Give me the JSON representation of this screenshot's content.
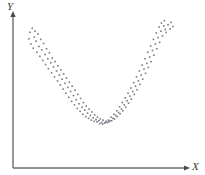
{
  "figure": {
    "kind": "scatter-plot",
    "background_color": "#ffffff",
    "axis_color": "#6b6b6b",
    "point_color": "#7a7a86",
    "width": 205,
    "height": 175
  },
  "axes": {
    "x": {
      "label": "X",
      "arrow": "arrow-right",
      "start_px": 13,
      "end_px": 189,
      "baseline_px": 168
    },
    "y": {
      "label": "Y",
      "arrow": "arrow-up",
      "start_px": 168,
      "end_px": 14,
      "baseline_px": 13
    }
  },
  "chart_data": {
    "type": "scatter",
    "title": "",
    "xlabel": "X",
    "ylabel": "Y",
    "xlim": [
      0,
      100
    ],
    "ylim": [
      0,
      100
    ],
    "grid": false,
    "legend": null,
    "annotations": [],
    "series": [
      {
        "name": "observations",
        "marker": "square",
        "marker_size_px": 1.6,
        "color": "#7a7a86",
        "points": [
          [
            6.0,
            86.0
          ],
          [
            7.4,
            89.5
          ],
          [
            9.1,
            87.0
          ],
          [
            5.4,
            80.5
          ],
          [
            8.6,
            82.0
          ],
          [
            10.8,
            84.5
          ],
          [
            6.6,
            76.0
          ],
          [
            9.7,
            78.5
          ],
          [
            12.5,
            80.0
          ],
          [
            8.0,
            72.5
          ],
          [
            11.4,
            74.0
          ],
          [
            14.2,
            76.5
          ],
          [
            10.2,
            69.0
          ],
          [
            13.1,
            71.0
          ],
          [
            16.0,
            72.0
          ],
          [
            12.0,
            65.5
          ],
          [
            15.1,
            67.0
          ],
          [
            17.7,
            68.5
          ],
          [
            13.7,
            62.0
          ],
          [
            16.8,
            63.5
          ],
          [
            19.4,
            64.0
          ],
          [
            15.4,
            58.5
          ],
          [
            18.5,
            60.0
          ],
          [
            21.1,
            61.0
          ],
          [
            17.1,
            55.0
          ],
          [
            20.2,
            56.5
          ],
          [
            22.8,
            57.5
          ],
          [
            19.0,
            51.5
          ],
          [
            22.0,
            53.0
          ],
          [
            24.6,
            54.0
          ],
          [
            20.8,
            48.0
          ],
          [
            23.7,
            49.5
          ],
          [
            26.3,
            50.5
          ],
          [
            22.6,
            44.5
          ],
          [
            25.4,
            46.0
          ],
          [
            28.0,
            47.0
          ],
          [
            24.3,
            41.0
          ],
          [
            27.1,
            42.5
          ],
          [
            29.7,
            43.5
          ],
          [
            26.0,
            37.5
          ],
          [
            28.8,
            39.0
          ],
          [
            31.4,
            40.0
          ],
          [
            27.7,
            34.0
          ],
          [
            30.5,
            35.5
          ],
          [
            33.1,
            36.5
          ],
          [
            29.4,
            30.5
          ],
          [
            32.2,
            32.0
          ],
          [
            34.8,
            33.0
          ],
          [
            31.1,
            27.0
          ],
          [
            33.9,
            28.5
          ],
          [
            36.5,
            29.5
          ],
          [
            32.8,
            24.0
          ],
          [
            35.6,
            25.0
          ],
          [
            38.2,
            26.0
          ],
          [
            34.5,
            21.0
          ],
          [
            37.3,
            22.0
          ],
          [
            39.9,
            23.0
          ],
          [
            36.2,
            18.5
          ],
          [
            39.0,
            19.5
          ],
          [
            41.6,
            20.5
          ],
          [
            37.9,
            16.0
          ],
          [
            40.7,
            17.0
          ],
          [
            43.3,
            18.0
          ],
          [
            39.6,
            14.0
          ],
          [
            42.4,
            15.0
          ],
          [
            45.0,
            15.5
          ],
          [
            41.3,
            12.5
          ],
          [
            44.1,
            13.0
          ],
          [
            46.7,
            13.5
          ],
          [
            43.0,
            11.0
          ],
          [
            45.8,
            11.5
          ],
          [
            48.4,
            12.0
          ],
          [
            44.7,
            10.0
          ],
          [
            47.5,
            10.5
          ],
          [
            50.1,
            11.0
          ],
          [
            46.4,
            9.5
          ],
          [
            49.2,
            9.0
          ],
          [
            51.8,
            10.0
          ],
          [
            48.1,
            8.0
          ],
          [
            50.9,
            8.5
          ],
          [
            53.5,
            9.5
          ],
          [
            49.8,
            7.5
          ],
          [
            52.6,
            9.0
          ],
          [
            55.2,
            10.5
          ],
          [
            51.5,
            9.0
          ],
          [
            54.3,
            10.5
          ],
          [
            56.9,
            12.0
          ],
          [
            53.2,
            11.0
          ],
          [
            56.0,
            12.5
          ],
          [
            58.6,
            14.0
          ],
          [
            54.9,
            13.5
          ],
          [
            57.7,
            15.0
          ],
          [
            60.3,
            16.5
          ],
          [
            56.6,
            16.0
          ],
          [
            59.4,
            17.5
          ],
          [
            62.0,
            19.0
          ],
          [
            58.3,
            19.0
          ],
          [
            61.1,
            20.5
          ],
          [
            63.7,
            22.0
          ],
          [
            60.0,
            22.5
          ],
          [
            62.8,
            24.0
          ],
          [
            65.4,
            25.5
          ],
          [
            61.7,
            26.0
          ],
          [
            64.5,
            27.5
          ],
          [
            67.1,
            29.0
          ],
          [
            63.4,
            30.0
          ],
          [
            66.2,
            31.5
          ],
          [
            68.8,
            33.0
          ],
          [
            65.1,
            34.0
          ],
          [
            67.9,
            35.5
          ],
          [
            70.5,
            37.0
          ],
          [
            66.8,
            38.5
          ],
          [
            69.6,
            40.0
          ],
          [
            72.2,
            41.5
          ],
          [
            68.5,
            43.0
          ],
          [
            71.3,
            44.5
          ],
          [
            73.9,
            46.0
          ],
          [
            70.2,
            48.0
          ],
          [
            73.0,
            49.5
          ],
          [
            75.6,
            51.0
          ],
          [
            71.9,
            53.0
          ],
          [
            74.7,
            54.5
          ],
          [
            77.3,
            56.0
          ],
          [
            73.6,
            58.0
          ],
          [
            76.4,
            59.5
          ],
          [
            79.0,
            61.0
          ],
          [
            75.3,
            63.5
          ],
          [
            78.1,
            65.0
          ],
          [
            80.7,
            66.5
          ],
          [
            77.0,
            69.0
          ],
          [
            79.8,
            70.5
          ],
          [
            82.4,
            72.0
          ],
          [
            78.7,
            74.5
          ],
          [
            81.5,
            76.0
          ],
          [
            84.1,
            77.5
          ],
          [
            80.4,
            80.0
          ],
          [
            83.2,
            81.5
          ],
          [
            85.8,
            83.0
          ],
          [
            82.1,
            85.5
          ],
          [
            84.9,
            87.0
          ],
          [
            87.5,
            88.5
          ],
          [
            83.8,
            90.5
          ],
          [
            86.6,
            91.5
          ],
          [
            89.2,
            92.5
          ],
          [
            88.0,
            86.0
          ],
          [
            90.4,
            89.0
          ],
          [
            85.2,
            94.0
          ],
          [
            91.0,
            94.5
          ],
          [
            87.0,
            96.0
          ],
          [
            92.1,
            91.0
          ]
        ]
      }
    ]
  }
}
